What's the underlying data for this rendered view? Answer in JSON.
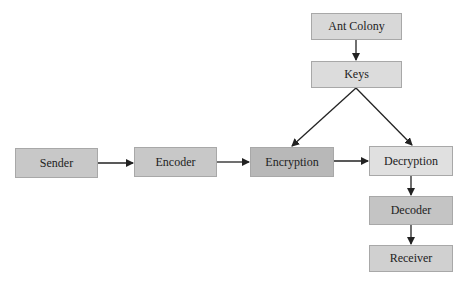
{
  "diagram": {
    "nodes": [
      {
        "id": "ant_colony",
        "label": "Ant Colony",
        "x": 311,
        "y": 13,
        "w": 91,
        "h": 27,
        "fill": "#d8d8d8"
      },
      {
        "id": "keys",
        "label": "Keys",
        "x": 311,
        "y": 61,
        "w": 91,
        "h": 27,
        "fill": "#dcdcdc"
      },
      {
        "id": "sender",
        "label": "Sender",
        "x": 15,
        "y": 148,
        "w": 83,
        "h": 30,
        "fill": "#c8c8c8"
      },
      {
        "id": "encoder",
        "label": "Encoder",
        "x": 134,
        "y": 147,
        "w": 83,
        "h": 30,
        "fill": "#c8c8c8"
      },
      {
        "id": "encryption",
        "label": "Encryption",
        "x": 250,
        "y": 147,
        "w": 84,
        "h": 30,
        "fill": "#b8b8b8"
      },
      {
        "id": "decryption",
        "label": "Decryption",
        "x": 369,
        "y": 146,
        "w": 84,
        "h": 30,
        "fill": "#e0e0e0"
      },
      {
        "id": "decoder",
        "label": "Decoder",
        "x": 369,
        "y": 196,
        "w": 84,
        "h": 29,
        "fill": "#c4c4c4"
      },
      {
        "id": "receiver",
        "label": "Receiver",
        "x": 369,
        "y": 245,
        "w": 84,
        "h": 27,
        "fill": "#d0d0d0"
      }
    ],
    "edges": [
      {
        "from": "ant_colony",
        "to": "keys"
      },
      {
        "from": "keys",
        "to": "encryption"
      },
      {
        "from": "keys",
        "to": "decryption"
      },
      {
        "from": "sender",
        "to": "encoder"
      },
      {
        "from": "encoder",
        "to": "encryption"
      },
      {
        "from": "encryption",
        "to": "decryption"
      },
      {
        "from": "decryption",
        "to": "decoder"
      },
      {
        "from": "decoder",
        "to": "receiver"
      }
    ]
  }
}
